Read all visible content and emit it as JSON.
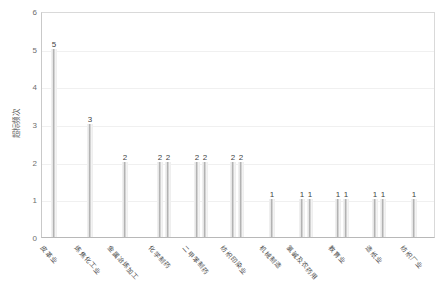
{
  "chart_data": {
    "type": "bar",
    "title": "",
    "xlabel": "",
    "ylabel": "超标频次",
    "ylim": [
      0,
      6
    ],
    "yticks": [
      "0",
      "1",
      "2",
      "3",
      "4",
      "5",
      "6"
    ],
    "grid": true,
    "legend": "none",
    "categories": [
      "皮革业",
      "炼焦业化工",
      "金属冶炼加工",
      "化学制药",
      "二甲苯制药",
      "纺织印染业",
      "机械制造",
      "氯碱及农药用",
      "教育业",
      "造纸业",
      "纺织厂业"
    ],
    "bars": [
      {
        "label": "皮革业",
        "value": 5,
        "value_label": "5",
        "x": 53
      },
      {
        "label": "炼焦化工业",
        "value": 3,
        "value_label": "3",
        "x": 89
      },
      {
        "label": "金属冶炼加工",
        "value": 2,
        "value_label": "2",
        "x": 124
      },
      {
        "label": "化学制药",
        "value": 2,
        "value_label": "2",
        "x": 159
      },
      {
        "label": "化学制药",
        "value": 2,
        "value_label": "2",
        "x": 167
      },
      {
        "label": "二甲苯制药",
        "value": 2,
        "value_label": "2",
        "x": 196
      },
      {
        "label": "二甲苯制药",
        "value": 2,
        "value_label": "2",
        "x": 204
      },
      {
        "label": "纺织印染业",
        "value": 2,
        "value_label": "2",
        "x": 232
      },
      {
        "label": "纺织印染业",
        "value": 2,
        "value_label": "2",
        "x": 240
      },
      {
        "label": "机械制造",
        "value": 1,
        "value_label": "1",
        "x": 271
      },
      {
        "label": "氯碱及农药用",
        "value": 1,
        "value_label": "1",
        "x": 301
      },
      {
        "label": "氯碱及农药用",
        "value": 1,
        "value_label": "1",
        "x": 309
      },
      {
        "label": "教育业",
        "value": 1,
        "value_label": "1",
        "x": 337
      },
      {
        "label": "教育业",
        "value": 1,
        "value_label": "1",
        "x": 345
      },
      {
        "label": "造纸业",
        "value": 1,
        "value_label": "1",
        "x": 374
      },
      {
        "label": "造纸业",
        "value": 1,
        "value_label": "1",
        "x": 382
      },
      {
        "label": "纺织厂业",
        "value": 1,
        "value_label": "1",
        "x": 413
      }
    ],
    "x_axis_labels": [
      {
        "text": "皮革业",
        "x": 46
      },
      {
        "text": "炼焦化工业",
        "x": 80
      },
      {
        "text": "金属冶炼加工",
        "x": 113
      },
      {
        "text": "化学制药",
        "x": 154
      },
      {
        "text": "二甲苯制药",
        "x": 188
      },
      {
        "text": "纺织印染业",
        "x": 226
      },
      {
        "text": "机械制造",
        "x": 265
      },
      {
        "text": "氯碱及农药用",
        "x": 292
      },
      {
        "text": "教育业",
        "x": 334
      },
      {
        "text": "造纸业",
        "x": 371
      },
      {
        "text": "纺织厂业",
        "x": 406
      }
    ],
    "colors": {
      "bar_fill": "#c9c9c9",
      "bar_fill_dark": "#a9a9a9",
      "gridline": "#f0f0f0",
      "axis": "#c9c9c9",
      "tick_text": "#6d6d6d",
      "label_text": "#4a4a4a",
      "value_text": "#3f3f3f",
      "background": "#ffffff"
    }
  }
}
